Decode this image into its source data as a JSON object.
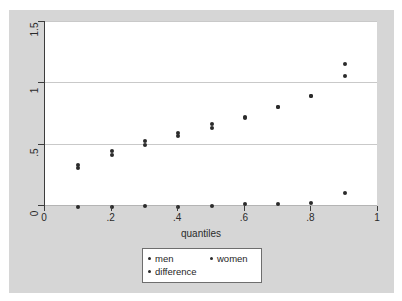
{
  "chart_data": {
    "type": "scatter",
    "title": "",
    "xlabel": "quantiles",
    "ylabel": "",
    "xlim": [
      0,
      1
    ],
    "ylim": [
      0,
      1.5
    ],
    "grid": true,
    "legend_position": "bottom",
    "xticks": [
      "0",
      ".2",
      ".4",
      ".6",
      ".8",
      "1"
    ],
    "xtick_values": [
      0,
      0.2,
      0.4,
      0.6,
      0.8,
      1
    ],
    "yticks": [
      "0",
      ".5",
      "1",
      "1.5"
    ],
    "ytick_values": [
      0,
      0.5,
      1,
      1.5
    ],
    "x": [
      0.1,
      0.2,
      0.3,
      0.4,
      0.5,
      0.6,
      0.7,
      0.8,
      0.9
    ],
    "series": [
      {
        "name": "men",
        "values": [
          0.33,
          0.44,
          0.52,
          0.59,
          0.66,
          0.72,
          0.8,
          0.89,
          1.15
        ]
      },
      {
        "name": "women",
        "values": [
          0.3,
          0.41,
          0.49,
          0.56,
          0.63,
          0.71,
          0.8,
          0.89,
          1.05
        ]
      },
      {
        "name": "difference",
        "values": [
          -0.02,
          -0.02,
          -0.01,
          -0.02,
          -0.01,
          0.005,
          0.005,
          0.02,
          0.1
        ]
      }
    ]
  },
  "legend": {
    "entries": [
      "men",
      "women",
      "difference"
    ]
  }
}
